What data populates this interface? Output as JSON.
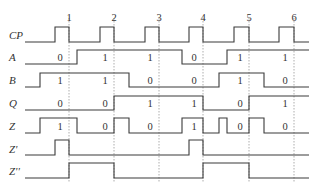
{
  "diagram": {
    "type": "timing-diagram",
    "clock_edges": [
      {
        "label": "1",
        "x": 69
      },
      {
        "label": "2",
        "x": 114
      },
      {
        "label": "3",
        "x": 159
      },
      {
        "label": "4",
        "x": 203
      },
      {
        "label": "5",
        "x": 249
      },
      {
        "label": "6",
        "x": 294
      }
    ],
    "x_start": 25,
    "x_end": 309,
    "grid_top": 18,
    "grid_bottom": 183,
    "signals": [
      {
        "name": "CP",
        "label": "CP",
        "y_high": 27,
        "y_low": 42,
        "label_y": 39,
        "transitions": [
          [
            25,
            0
          ],
          [
            55,
            1
          ],
          [
            69,
            0
          ],
          [
            100,
            1
          ],
          [
            114,
            0
          ],
          [
            145,
            1
          ],
          [
            159,
            0
          ],
          [
            189,
            1
          ],
          [
            203,
            0
          ],
          [
            234,
            1
          ],
          [
            249,
            0
          ],
          [
            279,
            1
          ],
          [
            294,
            0
          ],
          [
            309,
            0
          ]
        ],
        "values": []
      },
      {
        "name": "A",
        "label": "A",
        "y_high": 50,
        "y_low": 64,
        "label_y": 61,
        "transitions": [
          [
            25,
            0
          ],
          [
            77,
            1
          ],
          [
            182,
            0
          ],
          [
            227,
            1
          ],
          [
            309,
            1
          ]
        ],
        "values": [
          {
            "text": "0",
            "x": 60
          },
          {
            "text": "1",
            "x": 105
          },
          {
            "text": "1",
            "x": 150
          },
          {
            "text": "0",
            "x": 194
          },
          {
            "text": "1",
            "x": 240
          },
          {
            "text": "1",
            "x": 285
          }
        ],
        "value_y": 61
      },
      {
        "name": "B",
        "label": "B",
        "y_high": 73,
        "y_low": 87,
        "label_y": 84,
        "transitions": [
          [
            25,
            0
          ],
          [
            40,
            1
          ],
          [
            129,
            0
          ],
          [
            219,
            1
          ],
          [
            264,
            0
          ],
          [
            309,
            0
          ]
        ],
        "values": [
          {
            "text": "1",
            "x": 60
          },
          {
            "text": "1",
            "x": 105
          },
          {
            "text": "0",
            "x": 150
          },
          {
            "text": "0",
            "x": 194
          },
          {
            "text": "1",
            "x": 240
          },
          {
            "text": "0",
            "x": 285
          }
        ],
        "value_y": 84
      },
      {
        "name": "Q",
        "label": "Q",
        "y_high": 96,
        "y_low": 110,
        "label_y": 107,
        "transitions": [
          [
            25,
            0
          ],
          [
            114,
            1
          ],
          [
            203,
            0
          ],
          [
            249,
            1
          ],
          [
            309,
            1
          ]
        ],
        "values": [
          {
            "text": "0",
            "x": 60
          },
          {
            "text": "0",
            "x": 105
          },
          {
            "text": "1",
            "x": 150
          },
          {
            "text": "1",
            "x": 194
          },
          {
            "text": "0",
            "x": 240
          },
          {
            "text": "1",
            "x": 285
          }
        ],
        "value_y": 107
      },
      {
        "name": "Z",
        "label": "Z",
        "y_high": 118,
        "y_low": 133,
        "label_y": 130,
        "transitions": [
          [
            25,
            0
          ],
          [
            40,
            1
          ],
          [
            77,
            0
          ],
          [
            114,
            1
          ],
          [
            129,
            0
          ],
          [
            182,
            1
          ],
          [
            203,
            0
          ],
          [
            219,
            1
          ],
          [
            227,
            0
          ],
          [
            249,
            1
          ],
          [
            264,
            0
          ],
          [
            309,
            0
          ]
        ],
        "values": [
          {
            "text": "1",
            "x": 60
          },
          {
            "text": "0",
            "x": 105
          },
          {
            "text": "0",
            "x": 150
          },
          {
            "text": "1",
            "x": 194
          },
          {
            "text": "0",
            "x": 240
          },
          {
            "text": "0",
            "x": 285
          }
        ],
        "value_y": 130
      },
      {
        "name": "Z'",
        "label": "Z'",
        "y_high": 140,
        "y_low": 155,
        "label_y": 153,
        "transitions": [
          [
            25,
            0
          ],
          [
            55,
            1
          ],
          [
            69,
            0
          ],
          [
            189,
            1
          ],
          [
            203,
            0
          ],
          [
            309,
            0
          ]
        ],
        "values": []
      },
      {
        "name": "Z''",
        "label": "Z''",
        "y_high": 163,
        "y_low": 178,
        "label_y": 175,
        "transitions": [
          [
            25,
            0
          ],
          [
            69,
            1
          ],
          [
            114,
            0
          ],
          [
            203,
            1
          ],
          [
            249,
            0
          ],
          [
            309,
            0
          ]
        ],
        "values": []
      }
    ]
  }
}
